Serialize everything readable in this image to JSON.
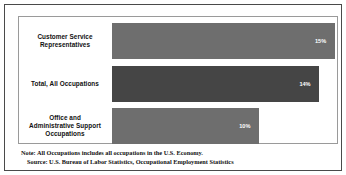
{
  "chart_data": {
    "type": "bar",
    "orientation": "horizontal",
    "title": "",
    "subtitle": "",
    "xlabel": "",
    "ylabel": "",
    "categories": [
      "Customer Service Representatives",
      "Total, All Occupations",
      "Office and Administrative Support Occupations"
    ],
    "values": [
      15,
      14,
      10
    ],
    "value_labels": [
      "15%",
      "14%",
      "10%"
    ],
    "unit": "%",
    "xlim": [
      0,
      16
    ],
    "grid": false,
    "legend": null,
    "bar_colors": [
      "#6e6e6e",
      "#454545",
      "#6e6e6e"
    ],
    "annotations": [
      "Note: All Occupations includes all occupations in the U.S. Economy.",
      "Source: U.S. Bureau of Labor Statistics, Occupational Employment Statistics"
    ]
  },
  "bars": [
    {
      "label_line1": "Customer Service",
      "label_line2": "Representatives",
      "label_line3": "",
      "value_label": "15%",
      "width_pct": 100,
      "color": "#6e6e6e"
    },
    {
      "label_line1": "Total, All Occupations",
      "label_line2": "",
      "label_line3": "",
      "value_label": "14%",
      "width_pct": 93,
      "color": "#454545"
    },
    {
      "label_line1": "Office and",
      "label_line2": "Administrative Support",
      "label_line3": "Occupations",
      "value_label": "10%",
      "width_pct": 66,
      "color": "#6e6e6e"
    }
  ],
  "notes": {
    "note": "Note: All Occupations includes all occupations in the U.S. Economy.",
    "source": "Source: U.S. Bureau of Labor Statistics, Occupational Employment Statistics"
  },
  "colors": {
    "outer_border": "#4a4a4a",
    "plot_border": "#9a9a9a",
    "bar_light": "#6e6e6e",
    "bar_dark": "#454545",
    "background": "#ffffff",
    "text": "#111111",
    "value_text": "#ffffff"
  }
}
